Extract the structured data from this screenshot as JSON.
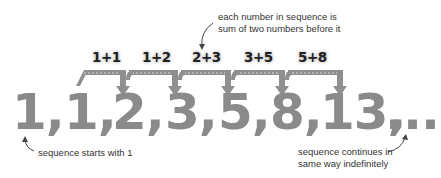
{
  "annotations": {
    "top": [
      "each number in sequence is",
      "sum of two numbers before it"
    ],
    "bottom_left": "sequence starts with 1",
    "bottom_right": [
      "sequence continues in",
      "same way indefinitely"
    ]
  },
  "sums": [
    "1+1",
    "1+2",
    "2+3",
    "3+5",
    "5+8"
  ],
  "sequence": [
    "1,",
    "1,",
    "2,",
    "3,",
    "5,",
    "8,",
    "13,",
    "..."
  ],
  "colors": {
    "number": "#8a8a8a",
    "bracket": "#8f8f8f",
    "text": "#333333"
  }
}
